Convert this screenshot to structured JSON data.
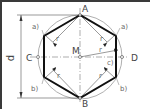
{
  "diagram": {
    "points": {
      "A": "A",
      "B": "B",
      "C": "C",
      "D": "D",
      "M": "M"
    },
    "radius_label": "r",
    "diameter_label": "d",
    "arc_labels": {
      "a_left": "a)",
      "a_right": "a)",
      "b_left": "b)",
      "b_right": "b)",
      "c_right": "c)"
    },
    "colors": {
      "outline": "#1a1a1a",
      "thin": "#555555",
      "circle": "#999999",
      "frame": "#3a3a3a"
    }
  }
}
